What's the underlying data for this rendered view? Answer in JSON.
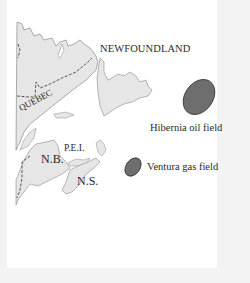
{
  "map": {
    "regions": {
      "newfoundland": "NEWFOUNDLAND",
      "quebec": "QUEBEC",
      "pei": "P.E.I.",
      "new_brunswick": "N.B.",
      "nova_scotia": "N.S."
    },
    "fields": {
      "hibernia": "Hibernia oil field",
      "ventura": "Ventura gas field"
    },
    "colors": {
      "land": "#e6e6e6",
      "coast": "#8a8a8a",
      "field_fill": "#6e6e6e",
      "border_frame": "#f3f3f3",
      "background": "#ffffff"
    }
  }
}
